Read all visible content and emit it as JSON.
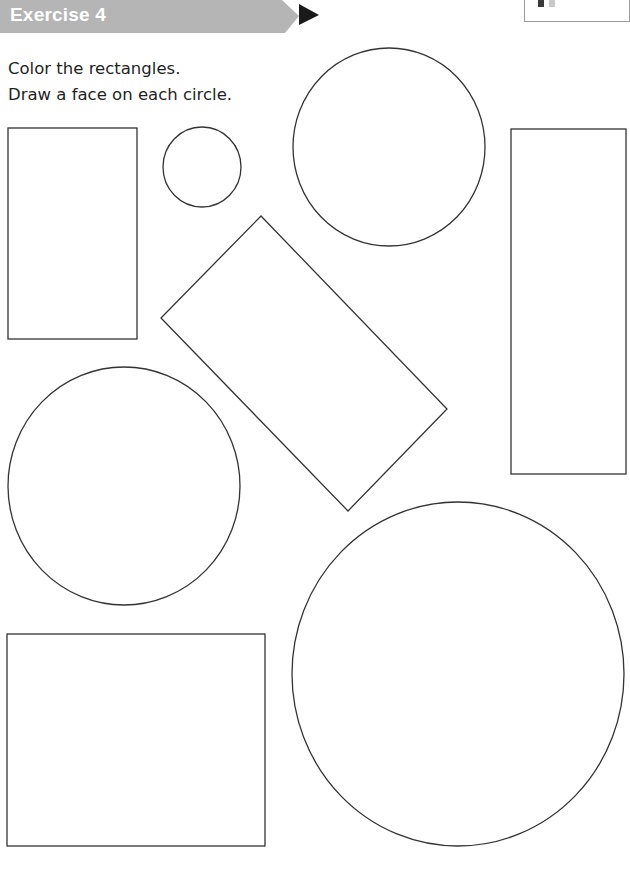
{
  "header": {
    "title": "Exercise 4",
    "bar_color": "#b5b5b5",
    "arrow_color": "#1a1a1a"
  },
  "corner_marker": {
    "swatches": [
      "#3a3a3a",
      "#c8c8c8"
    ]
  },
  "instructions": {
    "line1": "Color the rectangles.",
    "line2": "Draw a face on each circle."
  },
  "shapes": {
    "stroke_color": "#333333",
    "rectangles": [
      {
        "id": "rect-tall-left",
        "x": 8,
        "y": 128,
        "w": 129,
        "h": 211
      },
      {
        "id": "rect-tall-right",
        "x": 511,
        "y": 129,
        "w": 115,
        "h": 345
      },
      {
        "id": "rect-bottom-left",
        "x": 7,
        "y": 634,
        "w": 258,
        "h": 212
      }
    ],
    "rotated_rectangle": {
      "points": "261,216 447,409 348,511 161,318"
    },
    "circles": [
      {
        "id": "circle-small",
        "cx": 202,
        "cy": 167,
        "rx": 39,
        "ry": 40
      },
      {
        "id": "circle-top",
        "cx": 389,
        "cy": 147,
        "rx": 96,
        "ry": 99
      },
      {
        "id": "circle-middle-left",
        "cx": 124,
        "cy": 486,
        "rx": 116,
        "ry": 119
      },
      {
        "id": "circle-large",
        "cx": 458,
        "cy": 674,
        "rx": 166,
        "ry": 172
      }
    ]
  }
}
